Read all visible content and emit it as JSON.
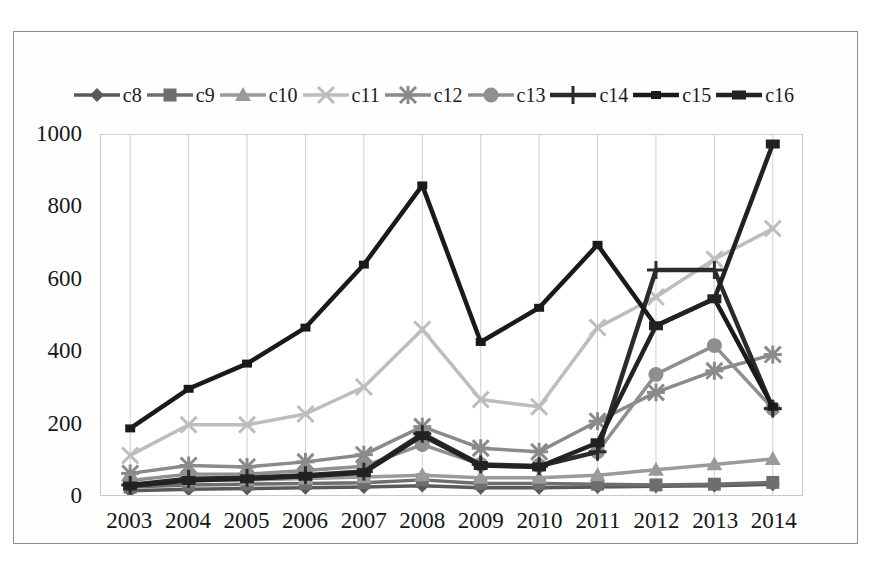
{
  "chart_data": {
    "type": "line",
    "title": "",
    "xlabel": "",
    "ylabel": "",
    "categories": [
      "2003",
      "2004",
      "2005",
      "2006",
      "2007",
      "2008",
      "2009",
      "2010",
      "2011",
      "2012",
      "2013",
      "2014"
    ],
    "ylim": [
      0,
      1000
    ],
    "yticks": [
      0,
      200,
      400,
      600,
      800,
      1000
    ],
    "grid": "vertical",
    "legend_position": "top",
    "series": [
      {
        "name": "c8",
        "marker": "diamond",
        "color": "#595959",
        "values": [
          12,
          16,
          18,
          20,
          22,
          26,
          20,
          20,
          22,
          24,
          26,
          30
        ]
      },
      {
        "name": "c9",
        "marker": "square",
        "color": "#6e6e6e",
        "values": [
          22,
          28,
          30,
          32,
          34,
          42,
          32,
          32,
          30,
          28,
          30,
          35
        ]
      },
      {
        "name": "c10",
        "marker": "triangle",
        "color": "#9a9a9a",
        "values": [
          30,
          40,
          42,
          46,
          50,
          55,
          48,
          48,
          55,
          70,
          85,
          100
        ]
      },
      {
        "name": "c11",
        "marker": "x",
        "color": "#bdbdbd",
        "values": [
          110,
          195,
          195,
          225,
          300,
          460,
          265,
          245,
          465,
          550,
          655,
          740
        ]
      },
      {
        "name": "c12",
        "marker": "asterisk",
        "color": "#8a8a8a",
        "values": [
          60,
          82,
          78,
          92,
          112,
          190,
          130,
          120,
          205,
          285,
          345,
          390
        ]
      },
      {
        "name": "c13",
        "marker": "circle",
        "color": "#8f8f8f",
        "values": [
          40,
          58,
          58,
          68,
          80,
          140,
          85,
          82,
          120,
          335,
          415,
          240
        ]
      },
      {
        "name": "c14",
        "marker": "plus",
        "color": "#2b2b2b",
        "values": [
          28,
          45,
          48,
          55,
          65,
          170,
          85,
          80,
          120,
          625,
          625,
          240
        ]
      },
      {
        "name": "c15",
        "marker": "bar",
        "color": "#1a1a1a",
        "values": [
          185,
          295,
          365,
          465,
          640,
          860,
          425,
          520,
          695,
          470,
          545,
          245
        ]
      },
      {
        "name": "c16",
        "marker": "thickbar",
        "color": "#222222",
        "values": [
          25,
          40,
          45,
          52,
          62,
          165,
          82,
          78,
          145,
          470,
          545,
          975
        ]
      }
    ]
  }
}
